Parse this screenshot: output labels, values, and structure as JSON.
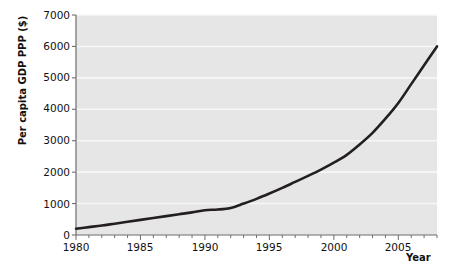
{
  "chart_data": {
    "type": "line",
    "title": "",
    "xlabel": "Year",
    "ylabel": "Per capita GDP PPP ($)",
    "xlim": [
      1980,
      2008
    ],
    "ylim": [
      0,
      7000
    ],
    "grid": true,
    "legend": "none",
    "x_ticks": [
      1980,
      1985,
      1990,
      1995,
      2000,
      2005
    ],
    "x_minor_tick_interval": 1,
    "y_ticks": [
      0,
      1000,
      2000,
      3000,
      4000,
      5000,
      6000,
      7000
    ],
    "series": [
      {
        "name": "Per capita GDP PPP ($)",
        "color": "#231f20",
        "x": [
          1980,
          1981,
          1982,
          1983,
          1984,
          1985,
          1986,
          1987,
          1988,
          1989,
          1990,
          1991,
          1992,
          1993,
          1994,
          1995,
          1996,
          1997,
          1998,
          1999,
          2000,
          2001,
          2002,
          2003,
          2004,
          2005,
          2006,
          2007,
          2008
        ],
        "values": [
          200,
          250,
          300,
          360,
          420,
          480,
          540,
          600,
          660,
          720,
          790,
          810,
          860,
          1000,
          1150,
          1320,
          1500,
          1690,
          1880,
          2080,
          2300,
          2550,
          2880,
          3250,
          3700,
          4200,
          4800,
          5400,
          6000
        ]
      }
    ]
  },
  "axes": {
    "y_tick_labels": [
      "7000",
      "6000",
      "5000",
      "4000",
      "3000",
      "2000",
      "1000",
      "0"
    ],
    "x_tick_labels": [
      "1980",
      "1985",
      "1990",
      "1995",
      "2000",
      "2005"
    ]
  },
  "style": {
    "plot_background": "#e6e6e6",
    "gridline_color": "#f7f7f7",
    "axis_color": "#6d6d6d",
    "line_color": "#231f20",
    "text_color": "#111111",
    "page_background": "#ffffff"
  }
}
